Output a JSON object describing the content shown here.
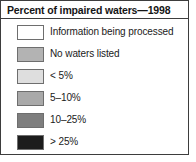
{
  "legend": {
    "title": "Percent of impaired waters—1998",
    "items": [
      {
        "label": "Information being processed",
        "color": "#ffffff",
        "swatch_name": "swatch-information-being-processed"
      },
      {
        "label": "No waters listed",
        "color": "#b3b3b3",
        "swatch_name": "swatch-no-waters-listed"
      },
      {
        "label": "< 5%",
        "color": "#dedede",
        "swatch_name": "swatch-under-5-percent"
      },
      {
        "label": "5–10%",
        "color": "#a9a9a9",
        "swatch_name": "swatch-5-to-10-percent"
      },
      {
        "label": "10–25%",
        "color": "#7e7e7e",
        "swatch_name": "swatch-10-to-25-percent"
      },
      {
        "label": "> 25%",
        "color": "#1c1c1c",
        "swatch_name": "swatch-over-25-percent"
      }
    ],
    "border_color": "#3d3d3d",
    "swatch_border_color": "#6e6e6e",
    "text_color": "#1a1a1a"
  }
}
